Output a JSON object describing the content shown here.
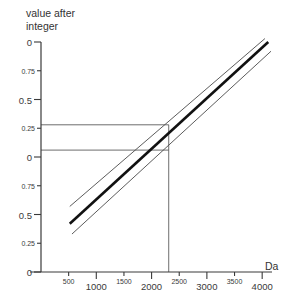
{
  "chart_data": {
    "type": "line",
    "title": "",
    "ylabel": "value after\ninteger",
    "xlabel": "Da",
    "xlim": [
      0,
      4250
    ],
    "ylim": [
      0,
      2
    ],
    "grid": false,
    "legend": "none",
    "x_ticks": [
      {
        "value": 500,
        "label": "500",
        "size": "small"
      },
      {
        "value": 1000,
        "label": "1000",
        "size": "big"
      },
      {
        "value": 1500,
        "label": "1500",
        "size": "small"
      },
      {
        "value": 2000,
        "label": "2000",
        "size": "big"
      },
      {
        "value": 2500,
        "label": "2500",
        "size": "small"
      },
      {
        "value": 3000,
        "label": "3000",
        "size": "big"
      },
      {
        "value": 3500,
        "label": "3500",
        "size": "small"
      },
      {
        "value": 4000,
        "label": "4000",
        "size": "big"
      }
    ],
    "y_ticks": [
      {
        "value": 2.0,
        "label": "0",
        "size": "big"
      },
      {
        "value": 1.75,
        "label": "0.75",
        "size": "small"
      },
      {
        "value": 1.5,
        "label": "0.5",
        "size": "big"
      },
      {
        "value": 1.25,
        "label": "0.25",
        "size": "small"
      },
      {
        "value": 1.0,
        "label": "0",
        "size": "big"
      },
      {
        "value": 0.75,
        "label": "0.75",
        "size": "small"
      },
      {
        "value": 0.5,
        "label": "0.5",
        "size": "big"
      },
      {
        "value": 0.25,
        "label": "0.25",
        "size": "small"
      },
      {
        "value": 0.0,
        "label": "0",
        "size": "big"
      }
    ],
    "series": [
      {
        "name": "upper-bound",
        "style": "thin",
        "color": "#4a4a4a",
        "width": 0.9,
        "points": [
          [
            520,
            0.57
          ],
          [
            4050,
            2.03
          ]
        ]
      },
      {
        "name": "center-line",
        "style": "thick",
        "color": "#111111",
        "width": 2.6,
        "points": [
          [
            520,
            0.42
          ],
          [
            4110,
            2.0
          ]
        ]
      },
      {
        "name": "lower-bound",
        "style": "thin",
        "color": "#4a4a4a",
        "width": 0.9,
        "points": [
          [
            560,
            0.33
          ],
          [
            4160,
            1.92
          ]
        ]
      }
    ],
    "reference_lines": {
      "color": "#5c5c5c",
      "width": 0.9,
      "upper_horizontal": {
        "y": 1.28,
        "x_from": 0,
        "x_to": 2310
      },
      "lower_horizontal": {
        "y": 1.06,
        "x_from": 0,
        "x_to": 2310
      },
      "vertical": {
        "x": 2310,
        "y_from": 0.0,
        "y_to": 1.28
      }
    },
    "annotations": []
  },
  "axis_geometry": {
    "plot_left": 41,
    "plot_right": 276,
    "plot_top": 42,
    "plot_bottom": 272,
    "y_axis_line_top": 42,
    "x_axis_line_y": 272
  }
}
